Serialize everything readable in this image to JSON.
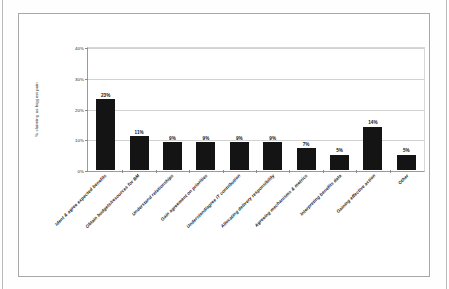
{
  "chart_data": {
    "type": "bar",
    "title": "",
    "xlabel": "",
    "ylabel": "% claiming as biggest pain",
    "ylim": [
      0,
      40
    ],
    "yticks": [
      "0%",
      "10%",
      "20%",
      "30%",
      "40%"
    ],
    "ytick_values": [
      0,
      10,
      20,
      30,
      40
    ],
    "grid": true,
    "legend": "none",
    "bar_color": "#141414",
    "categories": [
      "Ident & agree expected benefits",
      "Obtain budgets/resources for BM",
      "Understand relationships",
      "Gain agreement on priorities",
      "Understand/agree IT contribution",
      "Allocating delivery responsibility",
      "Agreeing mechanisms & metrics",
      "Interpreting benefits data",
      "Gaining effective action",
      "Other"
    ],
    "values": [
      23,
      11,
      9,
      9,
      9,
      9,
      7,
      5,
      14,
      5
    ],
    "data_labels": [
      "23%",
      "11%",
      "9%",
      "9%",
      "9%",
      "9%",
      "7%",
      "5%",
      "14%",
      "5%"
    ]
  }
}
